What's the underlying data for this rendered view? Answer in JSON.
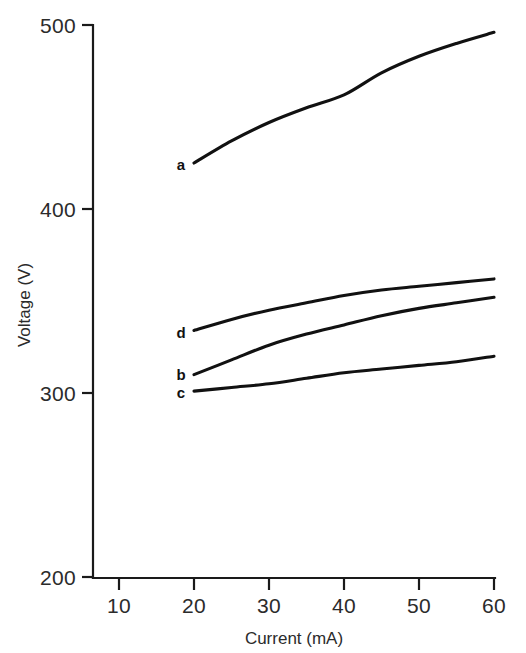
{
  "chart_data": {
    "type": "line",
    "title": "",
    "xlabel": "Current (mA)",
    "ylabel": "Voltage (V)",
    "xlim": [
      5,
      60
    ],
    "ylim": [
      200,
      500
    ],
    "xticks": [
      10,
      20,
      30,
      40,
      50,
      60
    ],
    "yticks": [
      200,
      300,
      400,
      500
    ],
    "xtick_labels": [
      "10",
      "20",
      "30",
      "40",
      "50",
      "60"
    ],
    "ytick_labels": [
      "200",
      "300",
      "400",
      "500"
    ],
    "grid": false,
    "legend": "inline-curve-labels",
    "x": [
      20,
      25,
      30,
      35,
      40,
      45,
      50,
      55,
      60
    ],
    "series": [
      {
        "name": "a",
        "label": "a",
        "values": [
          425,
          437,
          447,
          455,
          462,
          474,
          483,
          490,
          496
        ]
      },
      {
        "name": "d",
        "label": "d",
        "values": [
          334,
          340,
          345,
          349,
          353,
          356,
          358,
          360,
          362
        ]
      },
      {
        "name": "b",
        "label": "b",
        "values": [
          310,
          318,
          326,
          332,
          337,
          342,
          346,
          349,
          352
        ]
      },
      {
        "name": "c",
        "label": "c",
        "values": [
          301,
          303,
          305,
          308,
          311,
          313,
          315,
          317,
          320
        ]
      }
    ],
    "curve_label_positions": [
      {
        "label": "a",
        "x": 181,
        "y": 170
      },
      {
        "label": "d",
        "x": 181,
        "y": 338
      },
      {
        "label": "b",
        "x": 181,
        "y": 380
      },
      {
        "label": "c",
        "x": 181,
        "y": 398
      }
    ],
    "colors": {
      "curve": "#111111",
      "axis": "#1a1a1a",
      "text": "#2b2b2b",
      "background": "#ffffff"
    }
  },
  "axes": {
    "y_axis_label": "Voltage (V)",
    "x_axis_label": "Current (mA)"
  }
}
